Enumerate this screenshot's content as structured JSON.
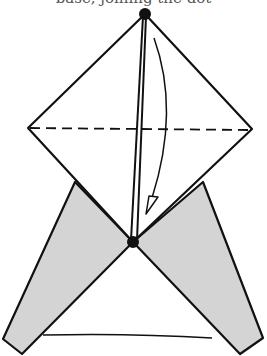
{
  "caption": {
    "text": "base, joining the dot"
  },
  "diagram": {
    "type": "origami-fold-instruction",
    "colors": {
      "line": "#111111",
      "flap_fill": "#d4d4d4",
      "paper": "#ffffff"
    },
    "points": {
      "top_dot": [
        145,
        14
      ],
      "bottom_dot": [
        133,
        242
      ],
      "left_corner": [
        28,
        128
      ],
      "right_corner": [
        252,
        129
      ]
    },
    "elements": [
      {
        "name": "diamond-upper-flap",
        "shape": "rhombus"
      },
      {
        "name": "horizontal-valley-fold-line",
        "style": "dashed"
      },
      {
        "name": "vertical-double-crease",
        "style": "double-line"
      },
      {
        "name": "fold-arrow",
        "direction": "down"
      },
      {
        "name": "left-shaded-flap",
        "fill": "grey"
      },
      {
        "name": "right-shaded-flap",
        "fill": "grey"
      },
      {
        "name": "base-edge-line"
      }
    ]
  }
}
